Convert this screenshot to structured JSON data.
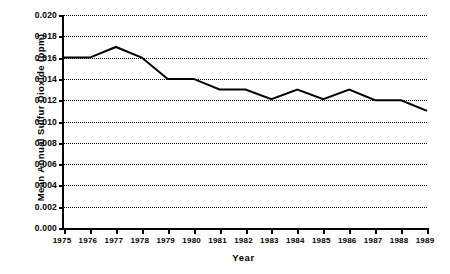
{
  "chart_data": {
    "type": "line",
    "title": "",
    "xlabel": "Year",
    "ylabel": "Mean Annual Sulfur Dioxide (ppm)",
    "categories": [
      "1975",
      "1976",
      "1977",
      "1978",
      "1979",
      "1980",
      "1981",
      "1982",
      "1983",
      "1984",
      "1985",
      "1986",
      "1987",
      "1988",
      "1989"
    ],
    "x": [
      1975,
      1976,
      1977,
      1978,
      1979,
      1980,
      1981,
      1982,
      1983,
      1984,
      1985,
      1986,
      1987,
      1988,
      1989
    ],
    "values": [
      0.016,
      0.016,
      0.017,
      0.016,
      0.014,
      0.014,
      0.013,
      0.013,
      0.0121,
      0.013,
      0.0121,
      0.013,
      0.012,
      0.012,
      0.011
    ],
    "series": [
      {
        "name": "Mean Annual Sulfur Dioxide",
        "values": [
          0.016,
          0.016,
          0.017,
          0.016,
          0.014,
          0.014,
          0.013,
          0.013,
          0.0121,
          0.013,
          0.0121,
          0.013,
          0.012,
          0.012,
          0.011
        ]
      }
    ],
    "xlim": [
      1975,
      1989
    ],
    "ylim": [
      0.0,
      0.02
    ],
    "ytick_values": [
      0.0,
      0.002,
      0.004,
      0.006,
      0.008,
      0.01,
      0.012,
      0.014,
      0.016,
      0.018,
      0.02
    ],
    "ytick_labels": [
      "0.000",
      "0.002",
      "0.004",
      "0.006",
      "0.008",
      "0.010",
      "0.012",
      "0.014",
      "0.016",
      "0.018",
      "0.020"
    ],
    "xtick_labels": [
      "1975",
      "1976",
      "1977",
      "1978",
      "1979",
      "1980",
      "1981",
      "1982",
      "1983",
      "1984",
      "1985",
      "1986",
      "1987",
      "1988",
      "1989"
    ],
    "grid": true,
    "grid_style": "dotted-horizontal",
    "legend": false,
    "legend_position": "none",
    "line_color": "#000000",
    "line_width": 2,
    "background_color": "#ffffff",
    "axis_color": "#000000"
  }
}
